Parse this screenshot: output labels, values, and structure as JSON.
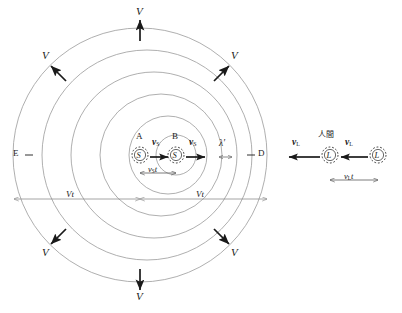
{
  "figure": {
    "type": "doppler-effect-diagram",
    "colors": {
      "wavefront": "#9a9a9a",
      "arrow": "#1a1a1a",
      "dimension": "#8d8d8d",
      "text": "#1a1a1a",
      "background": "#ffffff"
    },
    "wavefront_count": 6,
    "source_marker": "S",
    "listener_marker": "L"
  },
  "labels": {
    "wave_speed": "V",
    "source_point_a": "A",
    "source_point_b": "B",
    "source_velocity": "v",
    "source_velocity_sub": "S",
    "listener_velocity": "v",
    "listener_velocity_sub": "L",
    "wavelength_prime": "λ′",
    "point_left": "E",
    "point_right": "D",
    "listener_caption": "人間",
    "source_marker": "S",
    "listener_marker": "L"
  },
  "dimensions": {
    "vt_left": "Vt",
    "vt_right": "Vt",
    "vst": "v",
    "vst_sub": "S",
    "vst_tail": "t",
    "vlt": "v",
    "vlt_sub": "L",
    "vlt_tail": "t"
  },
  "velocity_arrows": [
    {
      "name": "v-top",
      "label": "V",
      "direction": "up"
    },
    {
      "name": "v-top-left",
      "label": "V",
      "direction": "up-left"
    },
    {
      "name": "v-top-right",
      "label": "V",
      "direction": "up-right"
    },
    {
      "name": "v-bottom-left",
      "label": "V",
      "direction": "down-left"
    },
    {
      "name": "v-bottom-right",
      "label": "V",
      "direction": "down-right"
    },
    {
      "name": "v-bottom",
      "label": "V",
      "direction": "down"
    }
  ]
}
